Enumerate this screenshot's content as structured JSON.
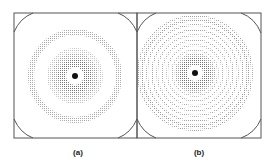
{
  "figure": {
    "panels": [
      {
        "id": "a",
        "label": "(a)",
        "center": [
          75,
          76
        ],
        "rings": [
          {
            "r": 13,
            "w": 8,
            "density": "dense"
          },
          {
            "r": 19,
            "w": 6,
            "density": "medium"
          },
          {
            "r": 24,
            "w": 5,
            "density": "light"
          },
          {
            "r": 44,
            "w": 5,
            "density": "light"
          }
        ]
      },
      {
        "id": "b",
        "label": "(b)",
        "center": [
          195,
          73
        ],
        "rings": [
          {
            "r": 12,
            "w": 8,
            "density": "dense"
          },
          {
            "r": 17,
            "w": 5,
            "density": "medium"
          },
          {
            "r": 23,
            "w": 3,
            "density": "light"
          },
          {
            "r": 29,
            "w": 2,
            "density": "light"
          },
          {
            "r": 34,
            "w": 2,
            "density": "light"
          },
          {
            "r": 39,
            "w": 2,
            "density": "light"
          },
          {
            "r": 44,
            "w": 2,
            "density": "light"
          },
          {
            "r": 49,
            "w": 2,
            "density": "light"
          },
          {
            "r": 54,
            "w": 2,
            "density": "light"
          },
          {
            "r": 58,
            "w": 2,
            "density": "light"
          }
        ]
      }
    ],
    "colors": {
      "frame": "#555555",
      "ring": "#777777",
      "dot": "#111111"
    }
  }
}
